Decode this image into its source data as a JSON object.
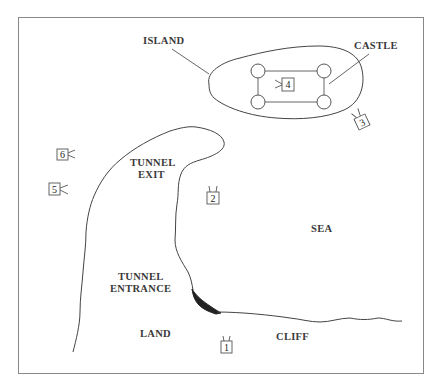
{
  "map": {
    "labels": {
      "island": "ISLAND",
      "castle": "CASTLE",
      "tunnel_exit_line1": "TUNNEL",
      "tunnel_exit_line2": "EXIT",
      "tunnel_entrance_line1": "TUNNEL",
      "tunnel_entrance_line2": "ENTRANCE",
      "sea": "SEA",
      "land": "LAND",
      "cliff": "CLIFF"
    },
    "markers": [
      {
        "id": "1",
        "label": "1"
      },
      {
        "id": "2",
        "label": "2"
      },
      {
        "id": "3",
        "label": "3"
      },
      {
        "id": "4",
        "label": "4"
      },
      {
        "id": "5",
        "label": "5"
      },
      {
        "id": "6",
        "label": "6"
      }
    ],
    "colors": {
      "frame": "#888888",
      "coastline": "#444444",
      "tunnel": "#222222",
      "text": "#3a3a3a"
    }
  }
}
